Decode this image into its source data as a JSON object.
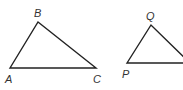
{
  "diagram": {
    "stroke_color": "#222222",
    "triangles": [
      {
        "name": "ABC",
        "vertices": [
          {
            "label": "A",
            "x": 10,
            "y": 68
          },
          {
            "label": "B",
            "x": 38,
            "y": 22
          },
          {
            "label": "C",
            "x": 96,
            "y": 68
          }
        ]
      },
      {
        "name": "PQR",
        "vertices": [
          {
            "label": "P",
            "x": 127,
            "y": 63
          },
          {
            "label": "Q",
            "x": 151,
            "y": 25
          },
          {
            "label": "",
            "x": 186,
            "y": 63
          }
        ]
      }
    ],
    "labels": {
      "A": "A",
      "B": "B",
      "C": "C",
      "P": "P",
      "Q": "Q"
    }
  }
}
